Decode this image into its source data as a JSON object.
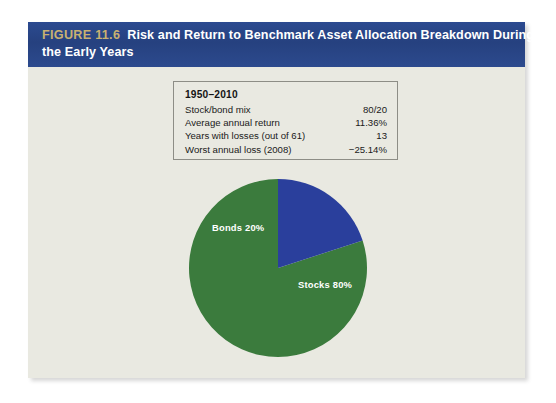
{
  "figure": {
    "number": "FIGURE 11.6",
    "title_line1": "Risk and Return to Benchmark Asset Allocation Breakdown During",
    "title_line2": "the Early Years",
    "header_bg": "#29448a",
    "number_color": "#c9b171",
    "panel_bg": "#e9e9e1"
  },
  "stats": {
    "title": "1950–2010",
    "rows": [
      {
        "label": "Stock/bond mix",
        "value": "80/20"
      },
      {
        "label": "Average annual return",
        "value": "11.36%"
      },
      {
        "label": "Years with losses (out of 61)",
        "value": "13"
      },
      {
        "label": "Worst annual loss (2008)",
        "value": "−25.14%"
      }
    ]
  },
  "chart_data": {
    "type": "pie",
    "title": "Risk and Return to Benchmark Asset Allocation Breakdown During the Early Years",
    "categories": [
      "Stocks",
      "Bonds"
    ],
    "values": [
      80,
      20
    ],
    "labels": [
      "Stocks 80%",
      "Bonds 20%"
    ],
    "colors": [
      "#3b7b3d",
      "#2a3f9c"
    ],
    "units": "percent",
    "legend": "none",
    "data_labels": true,
    "start_angle_deg": 0,
    "direction": "counterclockwise",
    "slices": [
      {
        "name": "Stocks",
        "value": 80,
        "label": "Stocks 80%",
        "color": "#3b7b3d"
      },
      {
        "name": "Bonds",
        "value": 20,
        "label": "Bonds 20%",
        "color": "#2a3f9c"
      }
    ]
  }
}
